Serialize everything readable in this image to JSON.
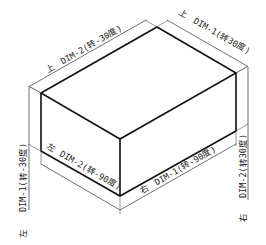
{
  "diagram": {
    "type": "isometric-box-dimension-labels",
    "colors": {
      "line": "#111111",
      "dimension": "#333333",
      "background": "#ffffff"
    },
    "labels": {
      "top_left": {
        "side": "上",
        "text": "DIM-2(转-30度)"
      },
      "top_right": {
        "side": "上",
        "text": "DIM-1(转30度)"
      },
      "left_face": {
        "side": "左",
        "text": "DIM-2(转-90度)"
      },
      "right_face": {
        "side": "右",
        "text": "DIM-1(转-90度)"
      },
      "left_vertical": {
        "side": "左",
        "text": "DIM-1(转-30度)"
      },
      "right_vertical": {
        "side": "右",
        "text": "DIM-2(转30度)"
      }
    }
  }
}
